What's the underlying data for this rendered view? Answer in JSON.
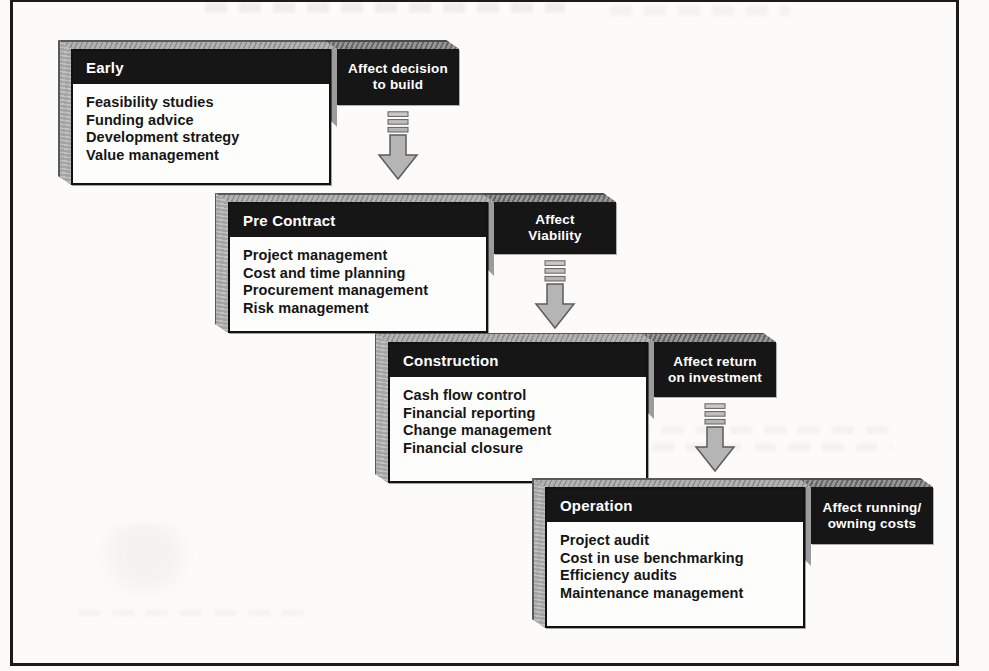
{
  "figure_type": "cascading process diagram",
  "colors": {
    "header_bg": "#161616",
    "box_bg": "#fdfdfc",
    "face_gray": "#b2b2b2",
    "arrow_gray": "#b5b5b5",
    "frame_border": "#1b1b1b",
    "text_light": "#ffffff",
    "text_dark": "#151515"
  },
  "stages": [
    {
      "title": "Early",
      "items": [
        "Feasibility studies",
        "Funding advice",
        "Development strategy",
        "Value management"
      ],
      "effect": [
        "Affect decision",
        "to build"
      ]
    },
    {
      "title": "Pre Contract",
      "items": [
        "Project management",
        "Cost and time planning",
        "Procurement management",
        "Risk management"
      ],
      "effect": [
        "Affect",
        "Viability"
      ]
    },
    {
      "title": "Construction",
      "items": [
        "Cash flow control",
        "Financial reporting",
        "Change management",
        "Financial closure"
      ],
      "effect": [
        "Affect return",
        "on investment"
      ]
    },
    {
      "title": "Operation",
      "items": [
        "Project audit",
        "Cost in use benchmarking",
        "Efficiency audits",
        "Maintenance management"
      ],
      "effect": [
        "Affect running/",
        "owning costs"
      ]
    }
  ]
}
